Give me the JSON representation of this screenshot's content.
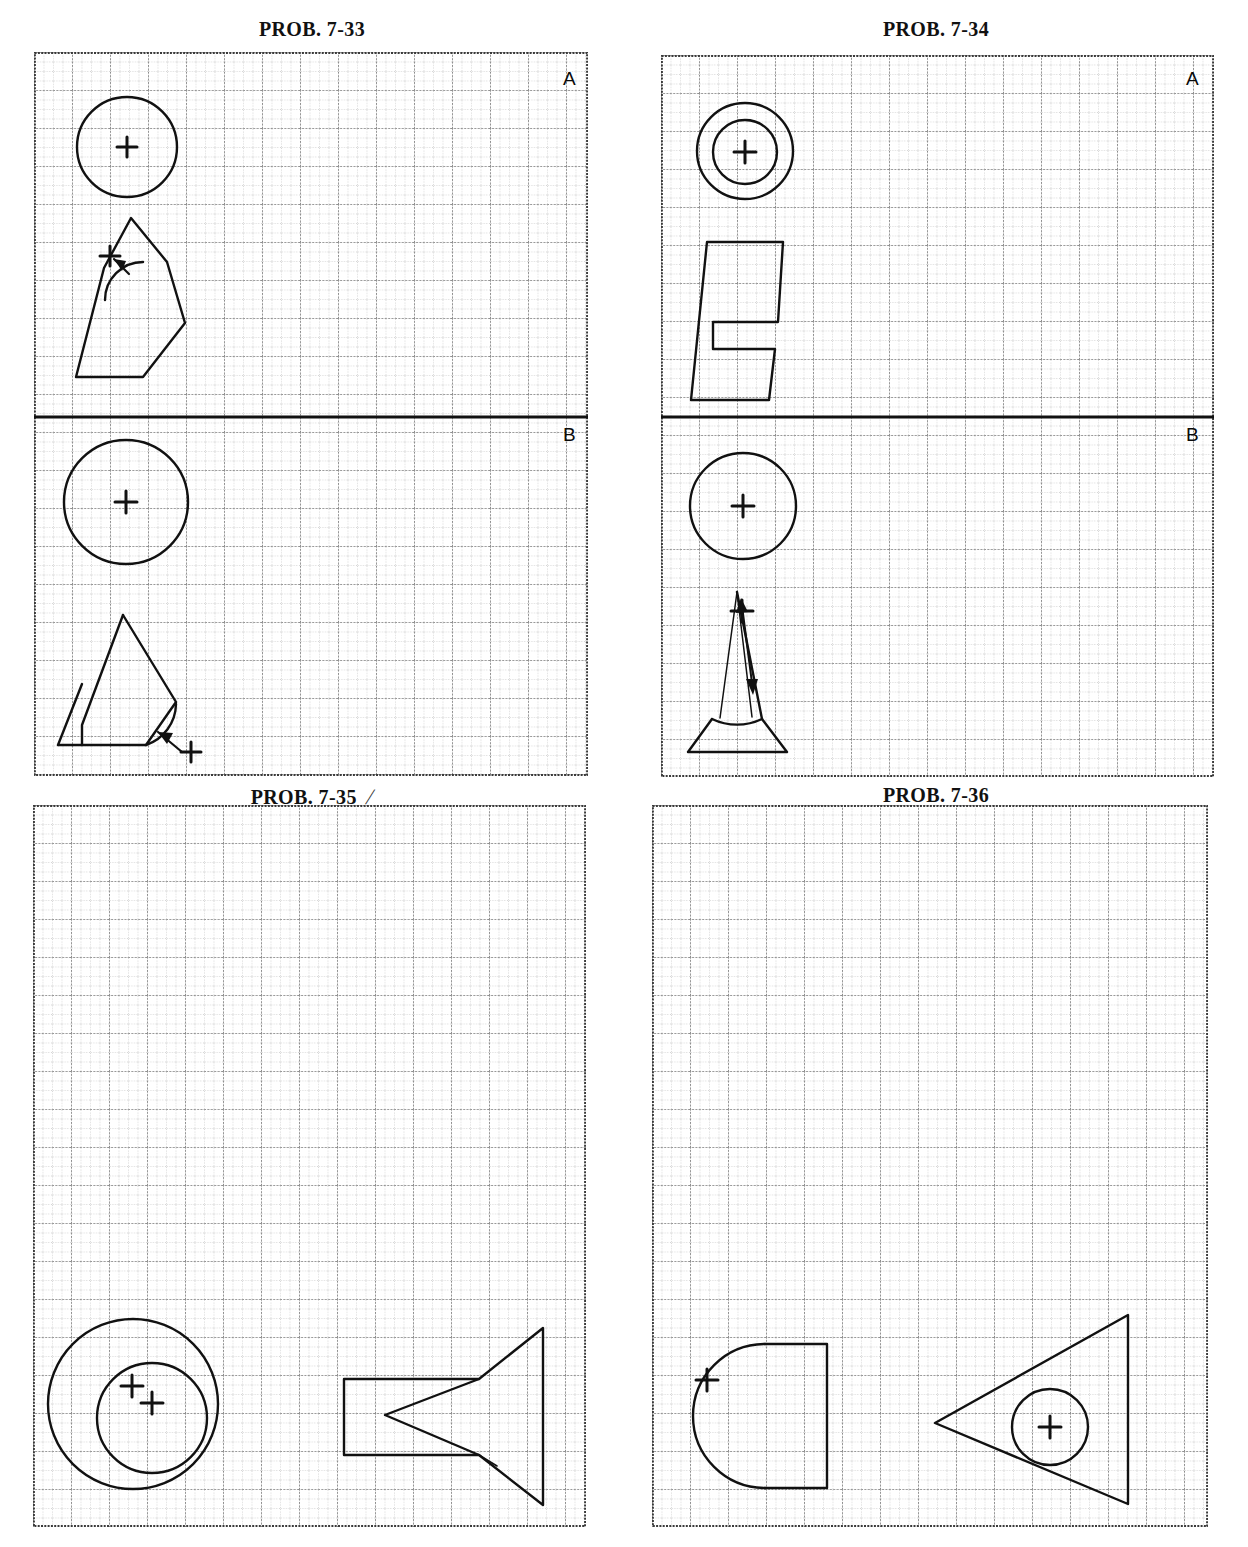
{
  "page": {
    "width": 1248,
    "height": 1547,
    "background": "#ffffff",
    "ink": "#111111",
    "grid_minor_color": "#8a8a8a",
    "grid_major_color": "#555555"
  },
  "panels": [
    {
      "id": "prob-7-33",
      "title": "PROB. 7-33",
      "title_tick": "",
      "labels": {
        "top_right": "A",
        "below_divider_right": "B"
      },
      "frame": {
        "x": 34,
        "y": 52,
        "w": 554,
        "h": 724
      },
      "grid": {
        "minor": 9.5,
        "major_every": 4
      },
      "divider_line": {
        "y": 417,
        "label": "B"
      },
      "shapes": [
        {
          "kind": "circle",
          "name": "circle-top-view-a",
          "cx": 127,
          "cy": 147,
          "r": 50,
          "center_mark": true
        },
        {
          "kind": "polygon-arc",
          "name": "notched-polygon-a",
          "points": "131,218 167,262 185,323 143,377 76,377 104,268",
          "arc": {
            "cx": 143,
            "cy": 262,
            "r": 38,
            "start": 180,
            "end": 265
          },
          "center_mark": {
            "x": 110,
            "y": 256
          },
          "arrow": {
            "x1": 128,
            "y1": 272,
            "x2": 115,
            "y2": 259
          }
        },
        {
          "kind": "circle",
          "name": "circle-top-view-b",
          "cx": 126,
          "cy": 502,
          "r": 62,
          "center_mark": true
        },
        {
          "kind": "polygon-arc",
          "name": "notched-polygon-b",
          "points": "123,615 176,702 146,745 58,745",
          "arc": {
            "cx": 146,
            "cy": 700,
            "r": 44,
            "start": 92,
            "end": 178
          },
          "center_mark": {
            "x": 191,
            "y": 752
          },
          "arrow": {
            "x1": 186,
            "y1": 747,
            "x2": 158,
            "y2": 727
          }
        }
      ]
    },
    {
      "id": "prob-7-34",
      "title": "PROB. 7-34",
      "title_tick": "",
      "labels": {
        "top_right": "A",
        "below_divider_right": "B"
      },
      "frame": {
        "x": 661,
        "y": 55,
        "w": 553,
        "h": 722
      },
      "grid": {
        "minor": 9.5,
        "major_every": 4
      },
      "divider_line": {
        "y": 417,
        "label": "B"
      },
      "shapes": [
        {
          "kind": "circle",
          "name": "outer-circle-a",
          "cx": 745,
          "cy": 151,
          "r": 48,
          "center_mark": false
        },
        {
          "kind": "circle",
          "name": "inner-circle-a",
          "cx": 745,
          "cy": 152,
          "r": 32,
          "center_mark": true
        },
        {
          "kind": "polyline-closed",
          "name": "e-block-shape",
          "points": "707,242 783,242 778,322 713,322 713,349 775,349 769,400 691,400"
        },
        {
          "kind": "circle",
          "name": "circle-top-view-b34",
          "cx": 743,
          "cy": 506,
          "r": 53,
          "center_mark": true
        },
        {
          "kind": "trapezoid-arc",
          "name": "cone-front-view",
          "points": "736,592 762,719 787,752 688,752 712,719",
          "arc": {
            "cx": 737,
            "cy": 672,
            "r": 52,
            "start": 34,
            "end": 146
          },
          "center_mark": {
            "x": 742,
            "y": 614
          },
          "arrow_double": {
            "x1": 742,
            "y1": 600,
            "x2": 752,
            "y2": 676
          }
        }
      ]
    },
    {
      "id": "prob-7-35",
      "title": "PROB. 7-35",
      "title_tick": "/",
      "labels": {
        "top_right": "",
        "below_divider_right": ""
      },
      "frame": {
        "x": 33,
        "y": 805,
        "w": 553,
        "h": 722
      },
      "grid": {
        "minor": 9.5,
        "major_every": 4
      },
      "divider_line": null,
      "shapes": [
        {
          "kind": "circle",
          "name": "large-circle-35",
          "cx": 133,
          "cy": 1404,
          "r": 85,
          "center_mark": false
        },
        {
          "kind": "circle",
          "name": "small-circle-35",
          "cx": 152,
          "cy": 1418,
          "r": 55,
          "center_mark": false
        },
        {
          "kind": "cross",
          "name": "center-mark-35-left",
          "x": 132,
          "y": 1386
        },
        {
          "kind": "cross",
          "name": "center-mark-35-right",
          "x": 152,
          "y": 1403
        },
        {
          "kind": "polyline-closed",
          "name": "vee-block-35",
          "points": "344,1379 479,1379 543,1328 543,1505 479,1455 344,1455"
        },
        {
          "kind": "polyline-open",
          "name": "vee-notch-35",
          "points": "479,1379 385,1415 479,1455"
        },
        {
          "kind": "polyline-open",
          "name": "vee-notch-tail-35",
          "points": "479,1455 497,1466"
        }
      ]
    },
    {
      "id": "prob-7-36",
      "title": "PROB. 7-36",
      "title_tick": "",
      "labels": {
        "top_right": "",
        "below_divider_right": ""
      },
      "frame": {
        "x": 652,
        "y": 805,
        "w": 556,
        "h": 722
      },
      "grid": {
        "minor": 9.5,
        "major_every": 4
      },
      "divider_line": null,
      "shapes": [
        {
          "kind": "keyhole",
          "name": "circle-with-tab-36",
          "circle": {
            "cx": 735,
            "cy": 1410,
            "r": 72
          },
          "tab": "793,1374 855,1374 855,1494 793,1494",
          "center_mark": {
            "x": 735,
            "y": 1410
          }
        },
        {
          "kind": "polyline-closed",
          "name": "triangle-36",
          "points": "963,1453 1156,1345 1156,1534"
        },
        {
          "kind": "circle",
          "name": "circle-in-triangle-36",
          "cx": 1078,
          "cy": 1457,
          "r": 38,
          "center_mark": true
        }
      ]
    }
  ]
}
